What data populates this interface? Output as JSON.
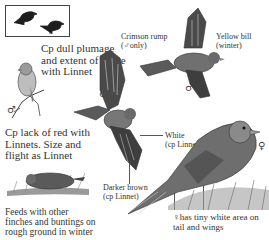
{
  "silhouette_box": {
    "icons": [
      "bird-silhouette-perched",
      "bird-silhouette-perched"
    ]
  },
  "labels": {
    "dull_plumage": "Cp dull plumage\nand extent of white\nwith Linnet",
    "crimson_rump": "Crimson rump\n(♂only)",
    "yellow_bill": "Yellow bill\n(winter)",
    "lack_of_red": "Cp lack of red with\nLinnets. Size and\nflight as Linnet",
    "white": "White\n(cp Linnet)",
    "darker_brown": "Darker brown\n(cp Linnet)",
    "feeds": "Feeds with other\nfinches and buntings on\nrough ground in winter",
    "female_note": "♀has tiny white area on\ntail and wings"
  },
  "symbols": {
    "male_perched": "♂",
    "male_flying": "♂",
    "male_flying_right": "♂",
    "female": "♀"
  },
  "colors": {
    "ink": "#333333",
    "bird_dark": "#3a3a3a",
    "bird_mid": "#6b6b6b",
    "bird_light": "#a8a8a8",
    "grass": "#8a8a8a"
  }
}
